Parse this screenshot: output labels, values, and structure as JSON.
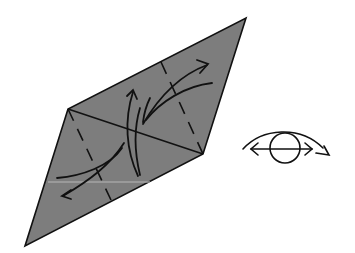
{
  "diagram": {
    "type": "origami-instruction-step",
    "colors": {
      "paper_fill": "#7d7d7d",
      "line": "#111111",
      "background": "#ffffff"
    },
    "paper": {
      "shape": "rhombus",
      "vertices": {
        "top": [
          246,
          18
        ],
        "right": [
          203,
          154
        ],
        "bottom": [
          25,
          246
        ],
        "left": [
          68,
          109
        ]
      }
    },
    "creases": [
      {
        "kind": "solid-diagonal",
        "from": [
          68,
          109
        ],
        "to": [
          203,
          154
        ]
      },
      {
        "kind": "valley-fold-dashed",
        "from": [
          161,
          62
        ],
        "to": [
          203,
          154
        ]
      },
      {
        "kind": "valley-fold-dashed",
        "from": [
          68,
          109
        ],
        "to": [
          111,
          200
        ]
      }
    ],
    "arrows": [
      {
        "name": "fold-arrow-upper-right",
        "direction": "up-right"
      },
      {
        "name": "fold-arrow-upper-return",
        "direction": "down-left"
      },
      {
        "name": "fold-arrow-center-up",
        "direction": "up"
      },
      {
        "name": "fold-arrow-center-down",
        "direction": "down"
      },
      {
        "name": "fold-arrow-lower-left",
        "direction": "down-left"
      },
      {
        "name": "fold-arrow-lower-return",
        "direction": "up-right"
      }
    ],
    "symbols": [
      {
        "name": "turn-over-view-eye",
        "meaning": "turn model over / view from other side",
        "position": [
          285,
          137
        ]
      }
    ]
  }
}
